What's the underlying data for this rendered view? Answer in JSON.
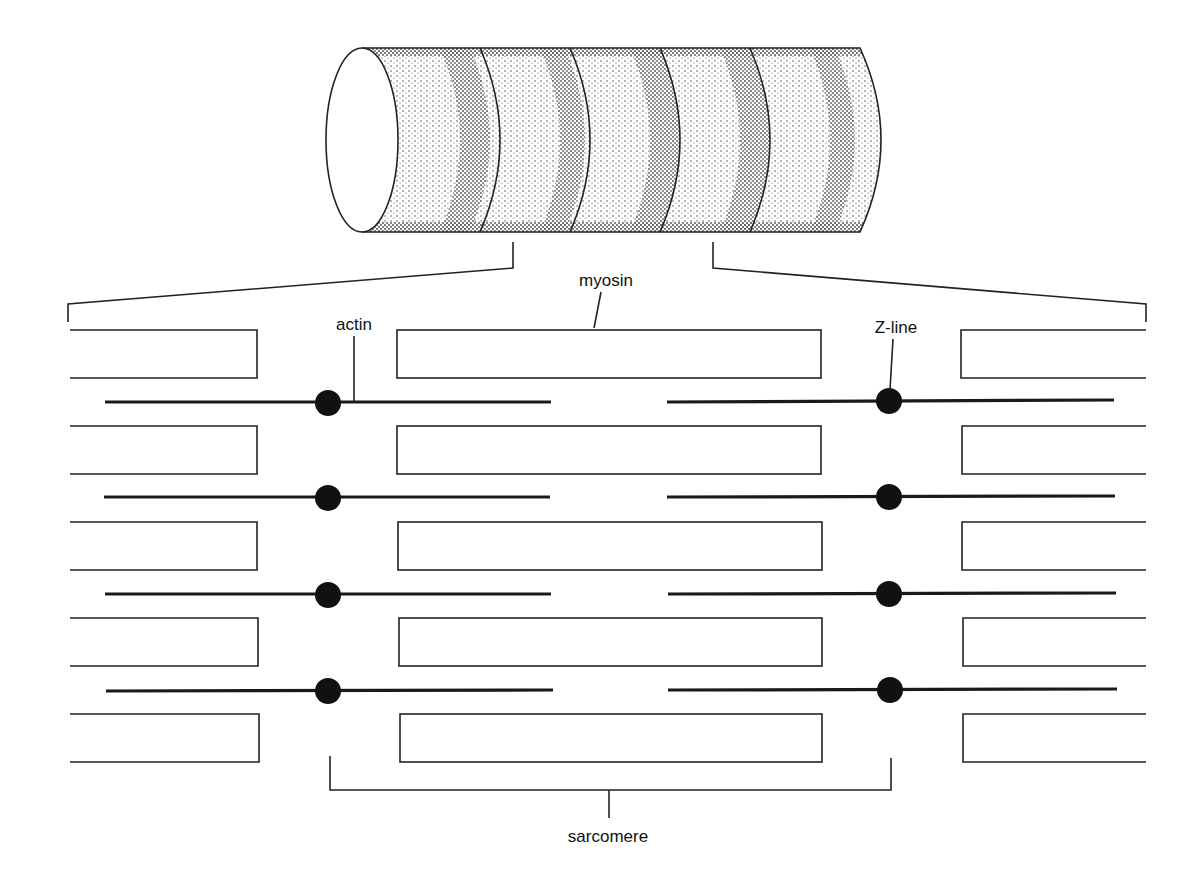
{
  "labels": {
    "myosin": "myosin",
    "actin": "actin",
    "zline": "Z-line",
    "sarcomere": "sarcomere"
  },
  "colors": {
    "ink": "#111111",
    "background": "#ffffff"
  },
  "muscle_fiber": {
    "description": "stippled cylinder with striations",
    "band_count": 5
  },
  "filament_rows": {
    "myosin_row_tops": [
      330,
      426,
      522,
      618,
      714
    ],
    "myosin_height": 48,
    "actin_line_y": [
      402,
      497,
      594,
      690
    ]
  }
}
